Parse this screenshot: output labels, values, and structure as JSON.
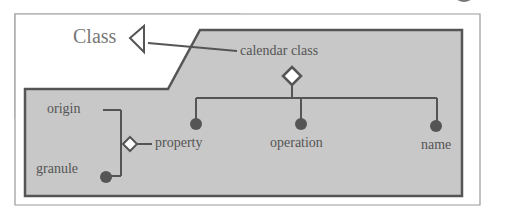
{
  "diagram": {
    "type": "uml-class-aggregation",
    "legend_label": "Class",
    "root_class": "calendar class",
    "children": [
      "property",
      "operation",
      "name"
    ],
    "property_parts": [
      "origin",
      "granule"
    ],
    "colors": {
      "panel_fill": "#c8c8c8",
      "stroke": "#555555",
      "frame_border": "#999999",
      "node_fill": "#555555",
      "diamond_fill": "#ffffff"
    }
  },
  "labels": {
    "class_legend": "Class",
    "root": "calendar class",
    "property": "property",
    "operation": "operation",
    "name": "name",
    "origin": "origin",
    "granule": "granule"
  }
}
